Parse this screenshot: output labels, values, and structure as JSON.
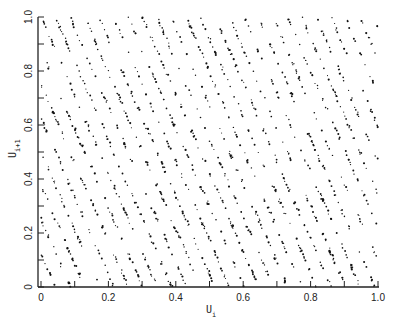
{
  "chart_data": {
    "type": "scatter",
    "title": "",
    "xlabel": "U",
    "xlabel_subscript": "i",
    "ylabel": "U",
    "ylabel_subscript": "i+1",
    "xlim": [
      0,
      1
    ],
    "ylim": [
      0,
      1
    ],
    "x_ticks": [
      0,
      0.1,
      0.2,
      0.3,
      0.4,
      0.5,
      0.6,
      0.7,
      0.8,
      0.9,
      1.0
    ],
    "y_ticks": [
      0,
      0.1,
      0.2,
      0.3,
      0.4,
      0.5,
      0.6,
      0.7,
      0.8,
      0.9,
      1.0
    ],
    "x_tick_labels": [
      "0",
      "0.2",
      "0.4",
      "0.6",
      "0.8",
      "1.0"
    ],
    "y_tick_labels": [
      "0",
      "0.2",
      "0.4",
      "0.6",
      "0.8",
      "1.0"
    ],
    "grid": false,
    "legend": null,
    "marker_color": "#111111",
    "pattern": {
      "description": "Successive pseudo-random pairs (U_i, U_i+1) fall on parallel lattice lines sloping down to the right",
      "line_slope": -2.9,
      "line_x_spacing": 0.043,
      "approx_line_count_across_x": 23,
      "approx_point_count": 2200
    }
  },
  "axes": {
    "x_label_main": "U",
    "x_label_sub": "i",
    "y_label_main": "U",
    "y_label_sub": "i+1"
  }
}
